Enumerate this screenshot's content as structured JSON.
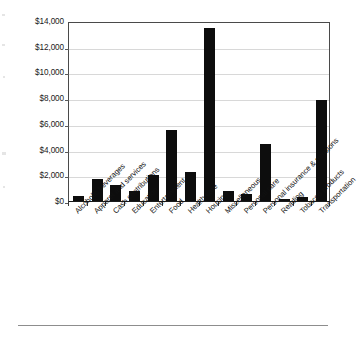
{
  "chart_data": {
    "type": "bar",
    "title": "",
    "subtitle": "",
    "xlabel": "",
    "ylabel": "",
    "ylim": [
      0,
      14000
    ],
    "grid": true,
    "legend": "none",
    "orientation": "vertical",
    "bar_color": "#0d0d0d",
    "categories": [
      "Alcoholic beverages",
      "Apparel and services",
      "Cash contributions",
      "Education",
      "Entertainment",
      "Food",
      "Health care",
      "Housing",
      "Miscellaneous",
      "Personal care",
      "Personal insurance & pensions",
      "Reading",
      "Tobacco products",
      "Transportation"
    ],
    "values": [
      380,
      1750,
      1260,
      750,
      2050,
      5500,
      2280,
      13430,
      780,
      530,
      4420,
      120,
      290,
      7850
    ],
    "ytick_labels": [
      "$0",
      "$2,000",
      "$4,000",
      "$6,000",
      "$8,000",
      "$10,000",
      "$12,000",
      "$14,000"
    ],
    "ytick_values": [
      0,
      2000,
      4000,
      6000,
      8000,
      10000,
      12000,
      14000
    ]
  },
  "page": {
    "rule_color": "#8d8d8d"
  }
}
